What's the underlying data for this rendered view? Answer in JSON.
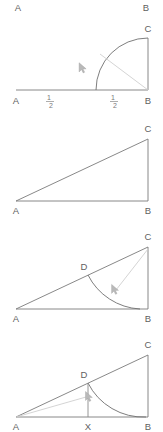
{
  "figure": {
    "background_color": "#ffffff",
    "edge_color": "#7a7a7a",
    "arc_color": "#6f6f6f",
    "radius_color": "#cfcfcf",
    "cursor_color": "#b9b9b9",
    "width": 163,
    "height": 432
  },
  "panels": [
    {
      "id": "panel-1",
      "name": "quarter-circle-panel",
      "labels": {
        "top_left": "A",
        "top_right": "B",
        "apex": "C",
        "origin": "A",
        "corner": "B"
      },
      "measures": [
        {
          "numerator": "1",
          "denominator": "2"
        },
        {
          "numerator": "1",
          "denominator": "2"
        }
      ],
      "cursor": {
        "x": 80,
        "y": 54
      }
    },
    {
      "id": "panel-2",
      "name": "right-triangle-panel",
      "labels": {
        "apex": "C",
        "origin": "A",
        "corner": "B"
      }
    },
    {
      "id": "panel-3",
      "name": "triangle-with-arc-panel",
      "labels": {
        "apex": "C",
        "origin": "A",
        "corner": "B",
        "arc_point": "D"
      },
      "cursor": {
        "x": 115,
        "y": 74
      }
    },
    {
      "id": "panel-4",
      "name": "triangle-with-perpendicular-panel",
      "labels": {
        "apex": "C",
        "origin": "A",
        "corner": "B",
        "arc_point": "D",
        "foot": "X"
      },
      "cursor": {
        "x": 93,
        "y": 73
      }
    }
  ],
  "header_labels": {
    "left": "A",
    "right": "B"
  }
}
